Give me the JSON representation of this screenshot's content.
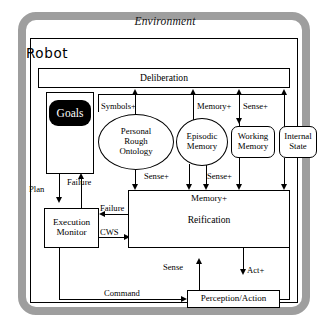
{
  "diagram": {
    "title": "Environment",
    "robot_label": "Robot",
    "nodes": {
      "deliberation": "Deliberation",
      "goals": "Goals",
      "personal_rough_ontology": "Personal\nRough\nOntology",
      "personal_rough_ontology_lines": [
        "Personal",
        "Rough",
        "Ontology"
      ],
      "episodic_memory_lines": [
        "Episodic",
        "Memory"
      ],
      "working_memory_lines": [
        "Working",
        "Memory"
      ],
      "internal_state_lines": [
        "Internal",
        "State"
      ],
      "reification_header": "Memory+",
      "reification": "Reification",
      "execution_monitor_lines": [
        "Execution",
        "Monitor"
      ],
      "perception_action": "Perception/Action"
    },
    "edges": {
      "symbols_plus": "Symbols+",
      "memory_plus_top": "Memory+",
      "sense_plus_top": "Sense+",
      "sense_plus_left": "Sense+",
      "sense_plus_right": "Sense+",
      "plan": "Plan",
      "failure_goals": "Failure",
      "failure_reification": "Failure",
      "cws": "CWS",
      "command": "Command",
      "sense": "Sense",
      "act_plus": "Act+"
    },
    "colors": {
      "environment_border": "#9e9e9e",
      "line": "#000000",
      "goals_fill": "#000000",
      "goals_text": "#ffffff",
      "background": "#ffffff"
    }
  }
}
